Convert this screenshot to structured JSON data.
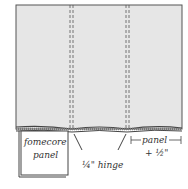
{
  "diagram": {
    "colors": {
      "fabric": "#e6e6e6",
      "outline": "#555555",
      "stitch": "#555555",
      "text": "#333333",
      "background": "#ffffff"
    },
    "labels": {
      "fomecore_line1": "fomecore",
      "fomecore_line2": "panel",
      "hinge": "¼\" hinge",
      "panel_line1": "panel",
      "panel_line2": "+ ½\""
    }
  }
}
